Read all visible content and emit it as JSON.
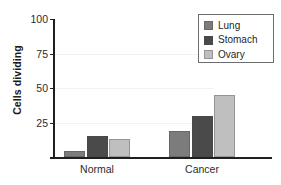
{
  "chart_data": {
    "type": "bar",
    "title": "",
    "subtitle": "",
    "xlabel": "",
    "ylabel": "Cells dividing",
    "categories": [
      "Normal",
      "Cancer"
    ],
    "series": [
      {
        "name": "Lung",
        "color": "#7c7c7c",
        "values": [
          4,
          19
        ]
      },
      {
        "name": "Stomach",
        "color": "#4a4a4a",
        "values": [
          15,
          30
        ]
      },
      {
        "name": "Ovary",
        "color": "#bfbfbf",
        "values": [
          13,
          45
        ]
      }
    ],
    "ylim": [
      0,
      100
    ],
    "yticks": [
      0,
      25,
      50,
      75,
      100
    ],
    "ytick_labels": [
      "",
      "25",
      "50",
      "75",
      "100"
    ],
    "grid": true,
    "legend_position": "top-right",
    "annotations": []
  },
  "legend": {
    "entries": [
      {
        "label": "Lung"
      },
      {
        "label": "Stomach"
      },
      {
        "label": "Ovary"
      }
    ]
  },
  "axis": {
    "y_title": "Cells dividing",
    "y_ticks": [
      {
        "label": "100",
        "value": 100
      },
      {
        "label": "75",
        "value": 75
      },
      {
        "label": "50",
        "value": 50
      },
      {
        "label": "25",
        "value": 25
      }
    ],
    "x_categories": [
      {
        "label": "Normal"
      },
      {
        "label": "Cancer"
      }
    ]
  }
}
